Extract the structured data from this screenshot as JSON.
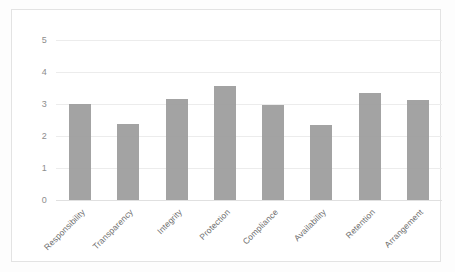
{
  "chart_data": {
    "type": "bar",
    "title": "",
    "subtitle": "",
    "xlabel": "",
    "ylabel": "",
    "categories": [
      "Responsibility",
      "Transparency",
      "Integrity",
      "Protection",
      "Compliance",
      "Availability",
      "Retention",
      "Arrangement"
    ],
    "values": [
      3.0,
      2.38,
      3.17,
      3.57,
      2.96,
      2.33,
      3.34,
      3.11
    ],
    "ylim": [
      0,
      5
    ],
    "yticks": [
      "0",
      "1",
      "2",
      "3",
      "4",
      "5"
    ],
    "ytick_values": [
      0,
      1,
      2,
      3,
      4,
      5
    ],
    "grid": true,
    "legend": false,
    "legend_position": "none",
    "series": [
      {
        "name": "",
        "values": [
          3.0,
          2.38,
          3.17,
          3.57,
          2.96,
          2.33,
          3.34,
          3.11
        ]
      }
    ],
    "annotations": [],
    "colors": {
      "bar": "#9b9b9b",
      "gridline": "#ececec",
      "axis_text": "#8d8d8d",
      "category_text": "#6f6f6f",
      "frame": "#e3e3e3",
      "background": "#ffffff"
    },
    "xtick_rotation": -45
  }
}
